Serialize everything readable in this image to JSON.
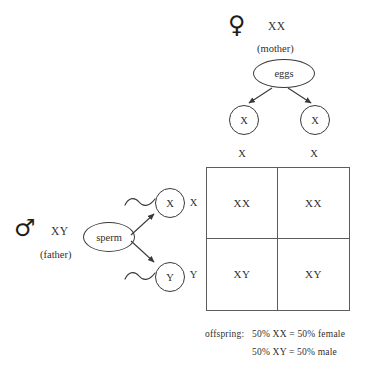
{
  "diagram": {
    "title_visible": false,
    "mother": {
      "symbol": "♀",
      "symbol_name": "female-symbol",
      "genotype": "XX",
      "role": "(mother)",
      "gamete_pool": "eggs",
      "gametes": [
        "X",
        "X"
      ]
    },
    "father": {
      "symbol": "♂",
      "symbol_name": "male-symbol",
      "genotype": "XY",
      "role": "(father)",
      "gamete_pool": "sperm",
      "gametes": [
        "X",
        "Y"
      ]
    },
    "punnett": {
      "column_headers": [
        "X",
        "X"
      ],
      "row_headers": [
        "X",
        "Y"
      ],
      "cells": [
        [
          "XX",
          "XX"
        ],
        [
          "XY",
          "XY"
        ]
      ]
    },
    "offspring": {
      "label": "offspring:",
      "lines": [
        "50% XX  =  50% female",
        "50% XY  =  50% male"
      ]
    },
    "colors": {
      "stroke": "#3a3a3a",
      "grid": "#5c5c5c",
      "text": "#2f2f2f",
      "background": "#ffffff"
    }
  }
}
